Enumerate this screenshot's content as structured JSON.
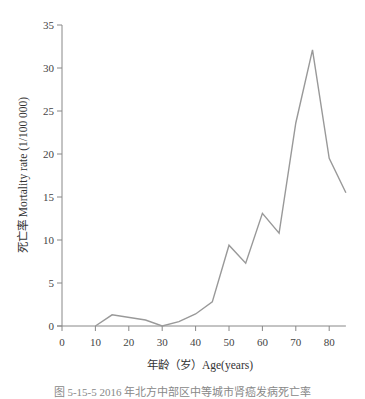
{
  "chart_data": {
    "type": "line",
    "title": "",
    "xlabel": "年龄（岁）Age(years)",
    "ylabel": "死亡率 Mortality rate (1/100 000)",
    "xlim": [
      0,
      85
    ],
    "ylim": [
      0,
      35
    ],
    "x_ticks": [
      0,
      10,
      20,
      30,
      40,
      50,
      60,
      70,
      80
    ],
    "y_ticks": [
      0,
      5,
      10,
      15,
      20,
      25,
      30,
      35
    ],
    "grid": false,
    "legend": null,
    "series": [
      {
        "name": "Mortality rate",
        "color": "#999999",
        "x": [
          10,
          15,
          25,
          30,
          35,
          40,
          45,
          50,
          55,
          60,
          65,
          70,
          75,
          80,
          85
        ],
        "y": [
          0,
          1.3,
          0.7,
          0,
          0.5,
          1.4,
          2.8,
          9.4,
          7.3,
          13.1,
          10.8,
          23.6,
          32.1,
          19.5,
          15.5
        ]
      }
    ]
  },
  "caption": "图 5-15-5 2016 年北方中部区中等城市肾癌发病死亡率"
}
